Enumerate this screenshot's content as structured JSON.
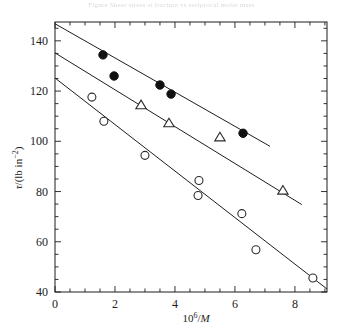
{
  "figure": {
    "top_caption": "Figure  Shear stress at fracture vs reciprocal  molar mass",
    "axes": {
      "y_label_parts": {
        "symbol": "τ",
        "slash": "/",
        "unit": "(lb in",
        "exp": "−2",
        "close": ")"
      },
      "x_label_parts": {
        "base": "10",
        "exp": "6",
        "slash": "/",
        "symbol": "M"
      },
      "y_ticks": [
        40,
        60,
        80,
        100,
        120,
        140
      ],
      "y_min": 40,
      "y_max": 147.5,
      "x_ticks": [
        0,
        2,
        4,
        6,
        8
      ],
      "x_min": 0,
      "x_max": 9.07,
      "x_minor_step": 0.5,
      "y_minor_step": 5,
      "frame_color": "#1d1d1d"
    }
  },
  "chart_data": {
    "type": "scatter",
    "title": "",
    "xlabel": "10^6 / M",
    "ylabel": "tau / (lb in^-2)",
    "xlim": [
      0,
      9.07
    ],
    "ylim": [
      40,
      147.5
    ],
    "grid": false,
    "legend": "none",
    "series": [
      {
        "name": "filled-circles",
        "marker": "filled-circle",
        "color": "#111111",
        "points": [
          {
            "x": 1.6,
            "y": 134.4
          },
          {
            "x": 1.97,
            "y": 126.0
          },
          {
            "x": 3.5,
            "y": 122.4
          },
          {
            "x": 3.87,
            "y": 118.8
          },
          {
            "x": 6.27,
            "y": 103.2
          }
        ],
        "fit_line": {
          "x0": 0.0,
          "y0": 146.8,
          "x1": 7.17,
          "y1": 98.0
        }
      },
      {
        "name": "open-triangles",
        "marker": "open-triangle",
        "color": "#2a2a2a",
        "points": [
          {
            "x": 2.87,
            "y": 114.4
          },
          {
            "x": 3.8,
            "y": 107.2
          },
          {
            "x": 5.5,
            "y": 101.6
          },
          {
            "x": 7.6,
            "y": 80.4
          }
        ],
        "fit_line": {
          "x0": 0.0,
          "y0": 135.2,
          "x1": 8.23,
          "y1": 74.8
        }
      },
      {
        "name": "open-circles",
        "marker": "open-circle",
        "color": "#2a2a2a",
        "points": [
          {
            "x": 1.23,
            "y": 117.6
          },
          {
            "x": 1.63,
            "y": 108.0
          },
          {
            "x": 3.0,
            "y": 94.4
          },
          {
            "x": 4.8,
            "y": 84.4
          },
          {
            "x": 4.77,
            "y": 78.4
          },
          {
            "x": 6.23,
            "y": 71.2
          },
          {
            "x": 6.7,
            "y": 56.8
          },
          {
            "x": 8.6,
            "y": 45.6
          }
        ],
        "fit_line": {
          "x0": 0.0,
          "y0": 125.2,
          "x1": 9.07,
          "y1": 41.2
        }
      }
    ]
  }
}
